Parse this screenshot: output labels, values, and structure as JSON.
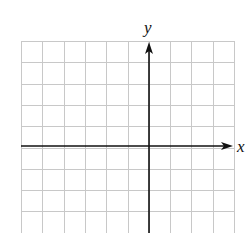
{
  "diagram": {
    "type": "coordinate-grid",
    "x_axis_label": "x",
    "y_axis_label": "y",
    "grid": {
      "left": 21,
      "top": 41,
      "cell": 21.3,
      "cols": 10,
      "rows": 9,
      "line_color": "#c8c8c8"
    },
    "axes": {
      "origin_x": 149,
      "origin_y": 146,
      "color": "#111111"
    }
  }
}
